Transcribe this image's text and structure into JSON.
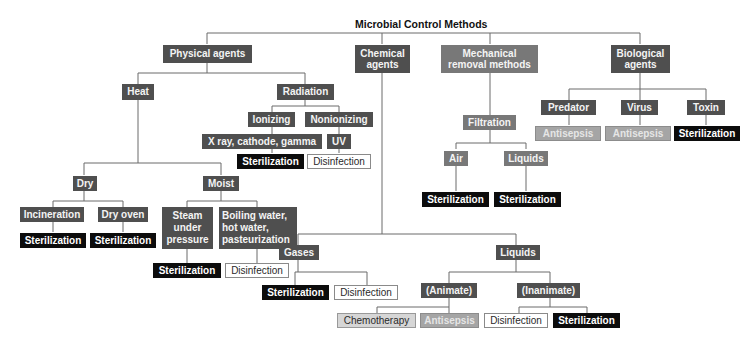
{
  "title": "Microbial Control Methods",
  "colors": {
    "category_dark": "#4f4f4f",
    "category_mid": "#787878",
    "sterilization": "#0c0c0c",
    "disinfection": "#ffffff",
    "antisepsis": "#a5a5a5",
    "chemotherapy": "#d6d6d6",
    "connector": "#6a6a6a"
  },
  "nodes": {
    "physical_agents": "Physical agents",
    "chemical_agents": "Chemical\nagents",
    "mechanical_removal": "Mechanical\nremoval methods",
    "biological_agents": "Biological\nagents",
    "heat": "Heat",
    "radiation": "Radiation",
    "ionizing": "Ionizing",
    "nonionizing": "Nonionizing",
    "xray": "X ray, cathode, gamma",
    "uv": "UV",
    "rad_sterilization": "Sterilization",
    "rad_disinfection": "Disinfection",
    "dry": "Dry",
    "moist": "Moist",
    "incineration": "Incineration",
    "dry_oven": "Dry oven",
    "incin_sterilization": "Sterilization",
    "oven_sterilization": "Sterilization",
    "steam": "Steam\nunder\npressure",
    "boiling": "Boiling water,\nhot water,\npasteurization",
    "steam_sterilization": "Sterilization",
    "boiling_disinfection": "Disinfection",
    "filtration": "Filtration",
    "air": "Air",
    "liquids_filter": "Liquids",
    "air_sterilization": "Sterilization",
    "liquids_sterilization": "Sterilization",
    "predator": "Predator",
    "virus": "Virus",
    "toxin": "Toxin",
    "predator_antisepsis": "Antisepsis",
    "virus_antisepsis": "Antisepsis",
    "toxin_sterilization": "Sterilization",
    "gases": "Gases",
    "liquids_chem": "Liquids",
    "gases_sterilization": "Sterilization",
    "gases_disinfection": "Disinfection",
    "animate": "(Animate)",
    "inanimate": "(Inanimate)",
    "chemotherapy": "Chemotherapy",
    "animate_antisepsis": "Antisepsis",
    "inanimate_disinfection": "Disinfection",
    "inanimate_sterilization": "Sterilization"
  }
}
